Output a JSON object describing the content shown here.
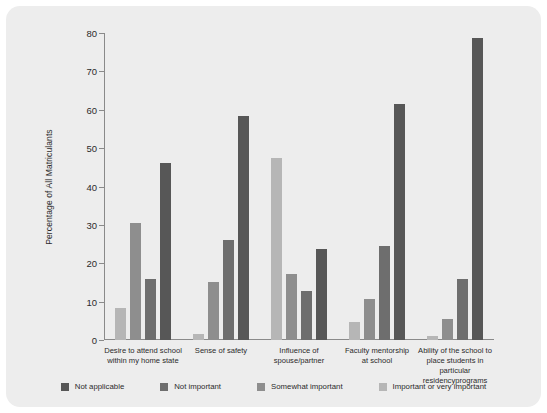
{
  "chart_data": {
    "type": "bar",
    "title": "",
    "xlabel": "",
    "ylabel": "Percentage of All Matriculants",
    "ylim": [
      0,
      80
    ],
    "yticks": [
      0,
      10,
      20,
      30,
      40,
      50,
      60,
      70,
      80
    ],
    "grid": false,
    "legend_position": "bottom",
    "categories": [
      "Desire to attend school\nwithin my home state",
      "Sense of safety",
      "Influence of\nspouse/partner",
      "Faculty mentorship\nat school",
      "Ability of the school to\nplace students in particular\nresidencyprograms"
    ],
    "series": [
      {
        "name": "Not applicable",
        "color": "#575757",
        "values": [
          46.2,
          58.4,
          23.8,
          61.5,
          78.8
        ]
      },
      {
        "name": "Not important",
        "color": "#6e6e6e",
        "values": [
          15.8,
          26.1,
          12.7,
          24.6,
          16.0
        ]
      },
      {
        "name": "Somewhat important",
        "color": "#8e8e8e",
        "values": [
          30.6,
          15.2,
          17.3,
          10.6,
          5.5
        ]
      },
      {
        "name": "Important or very important",
        "color": "#b6b6b6",
        "values": [
          8.4,
          1.5,
          47.5,
          4.7,
          1.0
        ]
      }
    ],
    "bar_order_within_group": [
      "Important or very important",
      "Somewhat important",
      "Not important",
      "Not applicable"
    ]
  },
  "legend": {
    "items": [
      {
        "label": "Not applicable",
        "color": "#575757"
      },
      {
        "label": "Not important",
        "color": "#6e6e6e"
      },
      {
        "label": "Somewhat important",
        "color": "#8e8e8e"
      },
      {
        "label": "Important or very important",
        "color": "#b6b6b6"
      }
    ]
  },
  "panel": {
    "background": "#ededed"
  }
}
